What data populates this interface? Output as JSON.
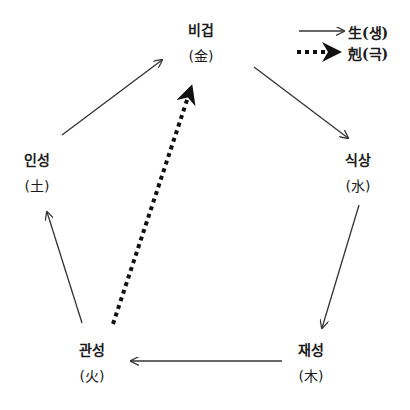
{
  "diagram": {
    "nodes": [
      {
        "id": "bigeop",
        "name": "비겁",
        "element": "(金)"
      },
      {
        "id": "siksang",
        "name": "식상",
        "element": "(水)"
      },
      {
        "id": "jaeseong",
        "name": "재성",
        "element": "(木)"
      },
      {
        "id": "gwanseong",
        "name": "관성",
        "element": "(火)"
      },
      {
        "id": "inseong",
        "name": "인성",
        "element": "(土)"
      }
    ],
    "edges": [
      {
        "from": "inseong",
        "to": "bigeop",
        "type": "generate"
      },
      {
        "from": "bigeop",
        "to": "siksang",
        "type": "generate"
      },
      {
        "from": "siksang",
        "to": "jaeseong",
        "type": "generate"
      },
      {
        "from": "jaeseong",
        "to": "gwanseong",
        "type": "generate"
      },
      {
        "from": "gwanseong",
        "to": "inseong",
        "type": "generate"
      },
      {
        "from": "gwanseong",
        "to": "bigeop",
        "type": "overcome"
      }
    ],
    "legend": [
      {
        "type": "generate",
        "label": "生(생)",
        "style": "solid-arrow"
      },
      {
        "type": "overcome",
        "label": "剋(극)",
        "style": "dotted-bold-arrow"
      }
    ],
    "colors": {
      "line": "#333333",
      "text": "#1a1a1a",
      "background": "#ffffff"
    }
  }
}
